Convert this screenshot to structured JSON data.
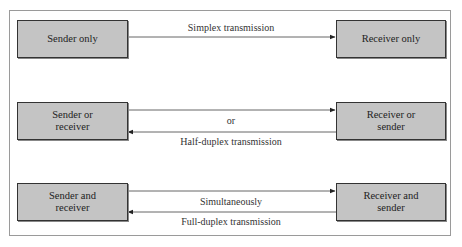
{
  "diagram": {
    "rows": [
      {
        "id": "simplex",
        "left_box": "Sender only",
        "right_box": "Receiver only",
        "top_label": "Simplex transmission",
        "middle_label": null,
        "bottom_label": null,
        "arrows": [
          "left-to-right"
        ]
      },
      {
        "id": "half-duplex",
        "left_box": "Sender  or\nreceiver",
        "right_box": "Receiver or\nsender",
        "top_label": null,
        "middle_label": "or",
        "bottom_label": "Half-duplex transmission",
        "arrows": [
          "left-to-right",
          "right-to-left"
        ]
      },
      {
        "id": "full-duplex",
        "left_box": "Sender and\nreceiver",
        "right_box": "Receiver and\nsender",
        "top_label": null,
        "middle_label": "Simultaneously",
        "bottom_label": "Full-duplex transmission",
        "arrows": [
          "left-to-right",
          "right-to-left"
        ]
      }
    ],
    "colors": {
      "box_fill": "#c4c4c4",
      "box_border": "#333333",
      "line": "#555555",
      "frame": "#9a9a9a"
    }
  }
}
